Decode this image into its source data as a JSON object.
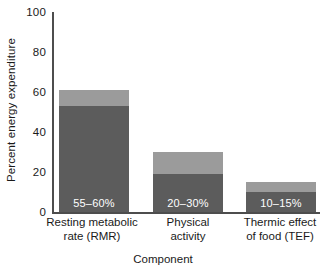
{
  "chart_data": {
    "type": "bar",
    "title": "",
    "xlabel": "Component",
    "ylabel": "Percent energy expenditure",
    "ylim": [
      0,
      100
    ],
    "yticks": [
      0,
      20,
      40,
      60,
      80,
      100
    ],
    "grid": false,
    "legend": "none",
    "categories": [
      "Resting metabolic rate (RMR)",
      "Physical activity",
      "Thermic effect of food (TEF)"
    ],
    "series": [
      {
        "name": "Range minimum",
        "values": [
          53,
          19,
          10
        ]
      },
      {
        "name": "Range maximum",
        "values": [
          61,
          30,
          15
        ]
      }
    ],
    "annotations": [
      "55–60%",
      "20–30%",
      "10–15%"
    ],
    "colors": {
      "lower_segment": "#5c5c5c",
      "upper_segment": "#9b9b9b",
      "axis": "#4d4d4d",
      "text": "#1a1a1a",
      "bar_label_text": "#ffffff",
      "background": "#ffffff"
    }
  },
  "axes": {
    "y_title": "Percent energy expenditure",
    "x_title": "Component",
    "y_tick_labels": [
      "100",
      "80",
      "60",
      "40",
      "20",
      "0"
    ]
  },
  "bars": [
    {
      "category_line1": "Resting metabolic",
      "category_line2": "rate (RMR)",
      "label": "55–60%",
      "low": 53,
      "high": 61
    },
    {
      "category_line1": "Physical",
      "category_line2": "activity",
      "label": "20–30%",
      "low": 19,
      "high": 30
    },
    {
      "category_line1": "Thermic effect",
      "category_line2": "of food (TEF)",
      "label": "10–15%",
      "low": 10,
      "high": 15
    }
  ]
}
